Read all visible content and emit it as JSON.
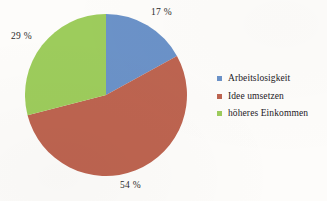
{
  "chart_data": {
    "type": "pie",
    "title": "",
    "categories": [
      "Arbeitslosigkeit",
      "Idee umsetzen",
      "höheres Einkommen"
    ],
    "values": [
      17,
      54,
      29
    ],
    "unit": "%",
    "data_labels": [
      "17 %",
      "54 %",
      "29 %"
    ],
    "colors": [
      "#6b92c8",
      "#bd6450",
      "#9dcc5c"
    ],
    "start_angle_deg": 0,
    "direction": "clockwise",
    "legend_position": "right",
    "grid": false,
    "background": "#fdfcfa"
  },
  "labels": {
    "slice_1": "17 %",
    "slice_2": "54 %",
    "slice_3": "29 %"
  },
  "legend": {
    "items": [
      {
        "label": "Arbeitslosigkeit",
        "color": "#6b92c8"
      },
      {
        "label": "Idee umsetzen",
        "color": "#bd6450"
      },
      {
        "label": "höheres Einkommen",
        "color": "#9dcc5c"
      }
    ]
  }
}
